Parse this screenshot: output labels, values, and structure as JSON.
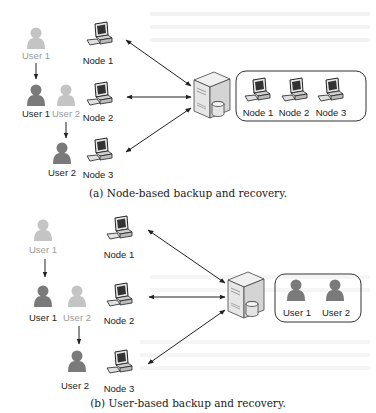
{
  "figure_a": {
    "caption": "(a) Node-based backup and recovery.",
    "users": [
      {
        "label": "User 1",
        "state": "faded"
      },
      {
        "label": "User 1",
        "state": "active"
      },
      {
        "label": "User 2",
        "state": "faded"
      },
      {
        "label": "User 2",
        "state": "active"
      }
    ],
    "nodes": [
      {
        "label": "Node 1"
      },
      {
        "label": "Node 2"
      },
      {
        "label": "Node 3"
      }
    ],
    "server_box": {
      "items": [
        {
          "label": "Node 1"
        },
        {
          "label": "Node 2"
        },
        {
          "label": "Node 3"
        }
      ]
    }
  },
  "figure_b": {
    "caption": "(b) User-based backup and recovery.",
    "users": [
      {
        "label": "User 1",
        "state": "faded"
      },
      {
        "label": "User 1",
        "state": "active"
      },
      {
        "label": "User 2",
        "state": "faded"
      },
      {
        "label": "User 2",
        "state": "active"
      }
    ],
    "nodes": [
      {
        "label": "Node 1"
      },
      {
        "label": "Node 2"
      },
      {
        "label": "Node 3"
      }
    ],
    "server_box": {
      "items": [
        {
          "label": "User 1"
        },
        {
          "label": "User 2"
        }
      ]
    }
  },
  "colors": {
    "user_active": "#7a7a7a",
    "user_faded": "#c4c4c4",
    "arrow": "#222222"
  }
}
